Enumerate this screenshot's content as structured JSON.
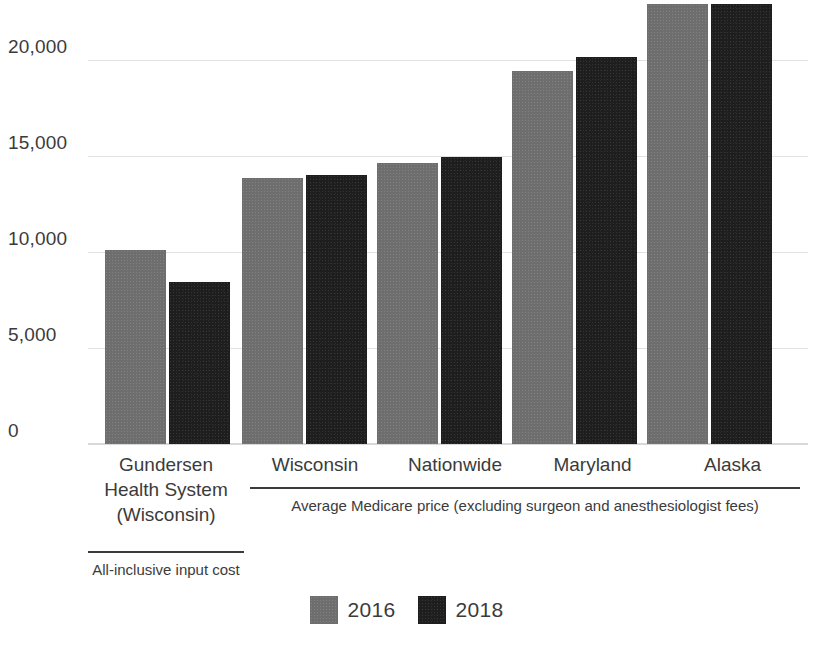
{
  "chart_data": {
    "type": "bar",
    "title": "",
    "subtitle": "",
    "xlabel": "",
    "ylabel": "",
    "categories": [
      "Gundersen Health System (Wisconsin)",
      "Wisconsin",
      "Nationwide",
      "Maryland",
      "Alaska"
    ],
    "category_lines": [
      [
        "Gundersen",
        "Health System",
        "(Wisconsin)"
      ],
      [
        "Wisconsin"
      ],
      [
        "Nationwide"
      ],
      [
        "Maryland"
      ],
      [
        "Alaska"
      ]
    ],
    "series": [
      {
        "name": "2016",
        "color": "#6e6e6e",
        "values": [
          10100,
          13850,
          14650,
          19450,
          22900
        ]
      },
      {
        "name": "2018",
        "color": "#1e1e1e",
        "values": [
          8450,
          14000,
          14950,
          20150,
          22900
        ]
      }
    ],
    "ylim": [
      0,
      23100
    ],
    "yticks": [
      0,
      5000,
      10000,
      15000,
      20000
    ],
    "ytick_labels": [
      "0",
      "5,000",
      "10,000",
      "15,000",
      "20,000"
    ],
    "grid": true,
    "y_axis_clipped_top": true,
    "legend_position": "bottom-center",
    "group_brackets": [
      {
        "caption": "All-inclusive input cost",
        "covers": [
          "Gundersen Health System (Wisconsin)"
        ]
      },
      {
        "caption": "Average Medicare price (excluding surgeon and anesthesiologist fees)",
        "covers": [
          "Wisconsin",
          "Nationwide",
          "Maryland",
          "Alaska"
        ]
      }
    ],
    "annotations": []
  },
  "legend": {
    "items": [
      {
        "label": "2016",
        "color": "#6e6e6e"
      },
      {
        "label": "2018",
        "color": "#1e1e1e"
      }
    ]
  },
  "colors": {
    "series_2016": "#6e6e6e",
    "series_2018": "#1e1e1e",
    "gridline": "#e2e2e2",
    "text": "#3b3b3b",
    "background": "#ffffff"
  }
}
